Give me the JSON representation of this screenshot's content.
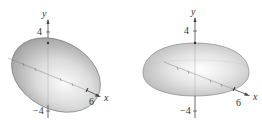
{
  "figures": [
    {
      "id": "left",
      "description": "Prolate ellipsoid (solid of revolution about the x-axis)",
      "axis_labels": {
        "y": "y",
        "x": "x"
      },
      "ticks": {
        "y_top": "4",
        "y_bottom": "−4",
        "x_right": "6"
      },
      "colors": {
        "surface_light": "#f2f2f2",
        "surface_dark": "#8c8c8c",
        "axis": "#444444"
      }
    },
    {
      "id": "right",
      "description": "Oblate half-ellipsoid dome (solid of revolution)",
      "axis_labels": {
        "y": "y",
        "x": "x"
      },
      "ticks": {
        "y_top": "4",
        "y_bottom": "−4",
        "x_right": "6"
      },
      "colors": {
        "surface_light": "#f4f4f4",
        "surface_dark": "#9a9a9a",
        "axis": "#444444"
      }
    }
  ]
}
